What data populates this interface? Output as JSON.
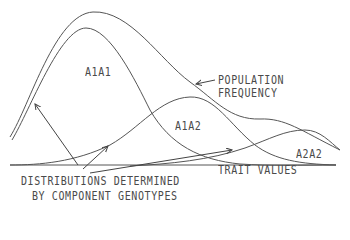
{
  "diagram": {
    "labels": {
      "a1a1": "A1A1",
      "a1a2": "A1A2",
      "a2a2": "A2A2",
      "population_line1": "POPULATION",
      "population_line2": "FREQUENCY",
      "trait_values": "TRAIT VALUES",
      "distributions_line1": "DISTRIBUTIONS DETERMINED",
      "distributions_line2": "BY COMPONENT GENOTYPES"
    },
    "curves": [
      {
        "name": "population-frequency",
        "description": "Overall population frequency curve (envelope)"
      },
      {
        "name": "a1a1-distribution",
        "description": "Genotype A1A1 distribution"
      },
      {
        "name": "a1a2-distribution",
        "description": "Genotype A1A2 distribution"
      },
      {
        "name": "a2a2-distribution",
        "description": "Genotype A2A2 distribution"
      }
    ],
    "colors": {
      "line": "#555555",
      "text": "#4a4a4a",
      "background": "#ffffff"
    }
  }
}
